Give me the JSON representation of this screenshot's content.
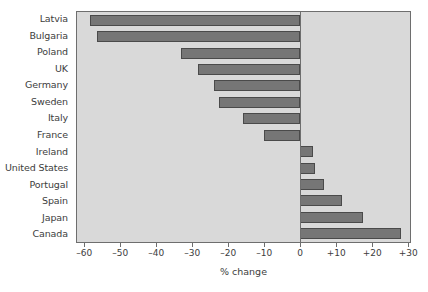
{
  "chart_data": {
    "type": "bar",
    "orientation": "horizontal",
    "title": "",
    "xlabel": "% change",
    "ylabel": "",
    "xlim": [
      -62,
      30.5
    ],
    "grid": false,
    "legend": null,
    "xticks": [
      -60,
      -50,
      -40,
      -30,
      -20,
      -10,
      0,
      10,
      20,
      30
    ],
    "xtick_labels": [
      "–60",
      "–50",
      "–40",
      "–30",
      "–20",
      "–10",
      "0",
      "+10",
      "+20",
      "+30"
    ],
    "categories": [
      "Latvia",
      "Bulgaria",
      "Poland",
      "UK",
      "Germany",
      "Sweden",
      "Italy",
      "France",
      "Ireland",
      "United States",
      "Portugal",
      "Spain",
      "Japan",
      "Canada"
    ],
    "values": [
      -58.5,
      -56.5,
      -33,
      -28.5,
      -24,
      -22.5,
      -16,
      -10,
      3.5,
      4,
      6.5,
      11.5,
      17.5,
      28
    ],
    "bar_color": "#767676",
    "bar_edge_color": "#4a4a4a",
    "plot_background": "#d9d9d9",
    "axis_color": "#6e6e6e",
    "figure_background": "#ffffff"
  }
}
